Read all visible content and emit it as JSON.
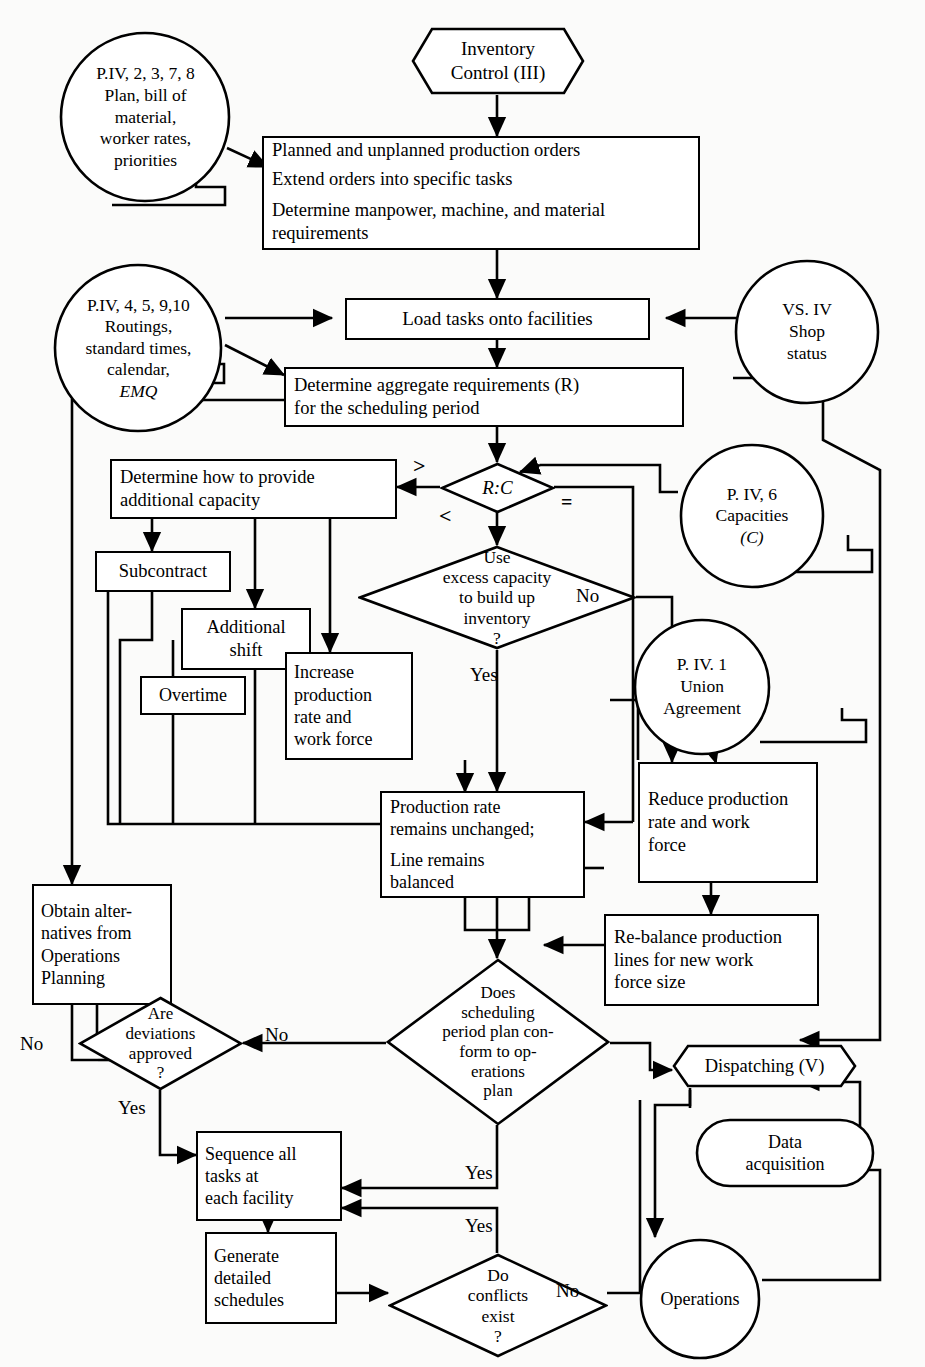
{
  "diagram": {
    "stroke_color": "#000000",
    "background_color": "#fbfbfa"
  },
  "nodes": {
    "inventory_control": {
      "label": "Inventory\nControl (III)",
      "shape": "hexagon"
    },
    "cloud_plan": {
      "label": "P.IV, 2, 3, 7, 8\nPlan, bill of\nmaterial,\nworker rates,\npriorities",
      "shape": "cloud"
    },
    "orders_box": {
      "line1": "Planned and unplanned production orders",
      "line2": "Extend orders into specific tasks",
      "line3": "Determine manpower, machine, and material requirements",
      "shape": "rect"
    },
    "cloud_routings": {
      "line1": "P.IV, 4, 5, 9,10",
      "line2": "Routings,",
      "line3": "standard  times,",
      "line4": "calendar,",
      "line5": "EMQ",
      "shape": "cloud"
    },
    "load_tasks": {
      "label": "Load tasks onto facilities",
      "shape": "rect"
    },
    "cloud_shop_status": {
      "label": "VS. IV\nShop\nstatus",
      "shape": "cloud"
    },
    "determine_aggregate": {
      "line1": "Determine aggregate requirements (R)",
      "line2": "for the scheduling period",
      "shape": "rect"
    },
    "rc_decision": {
      "label": "R:C",
      "shape": "diamond"
    },
    "cloud_capacities": {
      "line1": "P. IV, 6",
      "line2": "Capacities",
      "line3": "(C)",
      "shape": "cloud"
    },
    "determine_additional": {
      "label": "Determine how to provide\nadditional capacity",
      "shape": "rect"
    },
    "subcontract": {
      "label": "Subcontract",
      "shape": "rect"
    },
    "additional_shift": {
      "label": "Additional\nshift",
      "shape": "rect"
    },
    "overtime": {
      "label": "Overtime",
      "shape": "rect"
    },
    "increase_production": {
      "label": "Increase\nproduction\nrate and\nwork force",
      "shape": "rect"
    },
    "use_excess": {
      "label": "Use\nexcess capacity\nto build up\ninventory\n?",
      "shape": "diamond"
    },
    "cloud_union": {
      "label": "P. IV. 1\nUnion\nAgreement",
      "shape": "cloud"
    },
    "reduce_production": {
      "label": "Reduce production\nrate and work\nforce",
      "shape": "rect"
    },
    "production_unchanged": {
      "line1": "Production rate",
      "line2": "remains unchanged;",
      "line3": "Line remains",
      "line4": "balanced",
      "shape": "rect"
    },
    "rebalance": {
      "label": "Re-balance production\nlines for new work\nforce size",
      "shape": "rect"
    },
    "obtain_alternatives": {
      "label": "Obtain alter-\nnatives from\nOperations\nPlanning",
      "shape": "rect"
    },
    "are_deviations": {
      "label": "Are\ndeviations\napproved\n?",
      "shape": "diamond"
    },
    "does_scheduling": {
      "label": "Does\nscheduling\nperiod plan con-\nform to op-\nerations\nplan",
      "shape": "diamond"
    },
    "sequence_tasks": {
      "label": "Sequence all\ntasks at\neach facility",
      "shape": "rect"
    },
    "generate_schedules": {
      "label": "Generate\ndetailed\nschedules",
      "shape": "rect"
    },
    "do_conflicts": {
      "label": "Do\nconflicts\nexist\n?",
      "shape": "diamond"
    },
    "dispatching": {
      "label": "Dispatching (V)",
      "shape": "hexagon"
    },
    "data_acquisition": {
      "label": "Data\nacquisition",
      "shape": "stadium"
    },
    "operations": {
      "label": "Operations",
      "shape": "circle"
    }
  },
  "edge_labels": {
    "rc_greater": ">",
    "rc_less": "<",
    "rc_equal": "=",
    "excess_no": "No",
    "excess_yes": "Yes",
    "deviations_no_left": "No",
    "deviations_no_right": "No",
    "deviations_yes": "Yes",
    "scheduling_yes": "Yes",
    "conflicts_yes": "Yes",
    "conflicts_no": "No"
  }
}
